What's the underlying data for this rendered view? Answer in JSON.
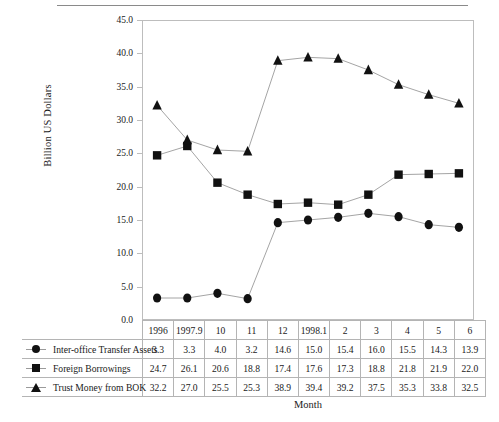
{
  "chart_data": {
    "type": "line",
    "title": "",
    "xlabel": "Month",
    "ylabel": "Billion US Dollars",
    "ylim": [
      0.0,
      45.0
    ],
    "ytick_labels": [
      "45.0",
      "40.0",
      "35.0",
      "30.0",
      "25.0",
      "20.0",
      "15.0",
      "10.0",
      "5.0",
      "0.0"
    ],
    "ytick_values": [
      45.0,
      40.0,
      35.0,
      30.0,
      25.0,
      20.0,
      15.0,
      10.0,
      5.0,
      0.0
    ],
    "grid": false,
    "legend_position": "table-left",
    "categories": [
      "1996",
      "1997.9",
      "10",
      "11",
      "12",
      "1998.1",
      "2",
      "3",
      "4",
      "5",
      "6"
    ],
    "series": [
      {
        "name": "Inter-office Transfer Assets",
        "marker": "circle",
        "values": [
          3.3,
          3.3,
          4.0,
          3.2,
          14.6,
          15.0,
          15.4,
          16.0,
          15.5,
          14.3,
          13.9
        ]
      },
      {
        "name": "Foreign Borrowings",
        "marker": "square",
        "values": [
          24.7,
          26.1,
          20.6,
          18.8,
          17.4,
          17.6,
          17.3,
          18.8,
          21.8,
          21.9,
          22.0
        ]
      },
      {
        "name": "Trust Money from BOK",
        "marker": "triangle",
        "values": [
          32.2,
          27.0,
          25.5,
          25.3,
          38.9,
          39.4,
          39.2,
          37.5,
          35.3,
          33.8,
          32.5
        ]
      }
    ],
    "colors": {
      "marker": "#111111",
      "line": "#9a9a9a",
      "axis": "#bdbdbd",
      "table_border": "#b4b4b4",
      "text": "#1a1a1a"
    }
  }
}
